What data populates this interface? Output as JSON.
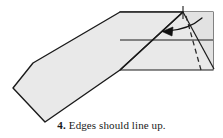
{
  "figure": {
    "kind": "origami-fold-diagram",
    "step_number": "4.",
    "caption_text": "Edges should line up.",
    "caption_full": "4. Edges should line up.",
    "colors": {
      "paper_fill": "#e7e7e7",
      "paper_fill_light": "#efefef",
      "outline": "#1a1a1a",
      "dashed_fold": "#2a2a2a",
      "arrow": "#111111",
      "background": "#ffffff",
      "caption_text": "#1a1a1a"
    },
    "shapes": {
      "wing_body": {
        "name": "left-wing-panel",
        "points": "33,63 120,12 183,12 120,70 45,122 13,88"
      },
      "folded_rectangle": {
        "name": "folded-rectangle-panel",
        "points": "120,12 213,12 213,70 120,70"
      },
      "inner_triangle": {
        "name": "inner-fold-triangle",
        "points": "183,12 213,12 213,70"
      }
    },
    "lines": {
      "crease_horizontal": {
        "name": "horizontal-crease",
        "x1": 120,
        "y1": 40,
        "x2": 213,
        "y2": 40
      },
      "fold_diagonal": {
        "name": "diagonal-fold-edge",
        "x1": 183,
        "y1": 12,
        "x2": 120,
        "y2": 70
      },
      "apex_to_corner": {
        "name": "apex-to-bottom-right-edge",
        "x1": 183,
        "y1": 12,
        "x2": 213,
        "y2": 68
      },
      "dashed_fold": {
        "name": "dashed-fold-line",
        "x1": 186,
        "y1": 17,
        "x2": 201,
        "y2": 70
      },
      "tick_mark": {
        "name": "apex-tick-mark",
        "x1": 183,
        "y1": 7,
        "x2": 183,
        "y2": 18
      }
    },
    "arrow": {
      "name": "fold-direction-arrow",
      "label": "curved-fold-arrow-pointing-left",
      "path": "M 200,19 C 193,25 182,30 166,31",
      "head_points": "163,31 172,27 171,35"
    }
  }
}
